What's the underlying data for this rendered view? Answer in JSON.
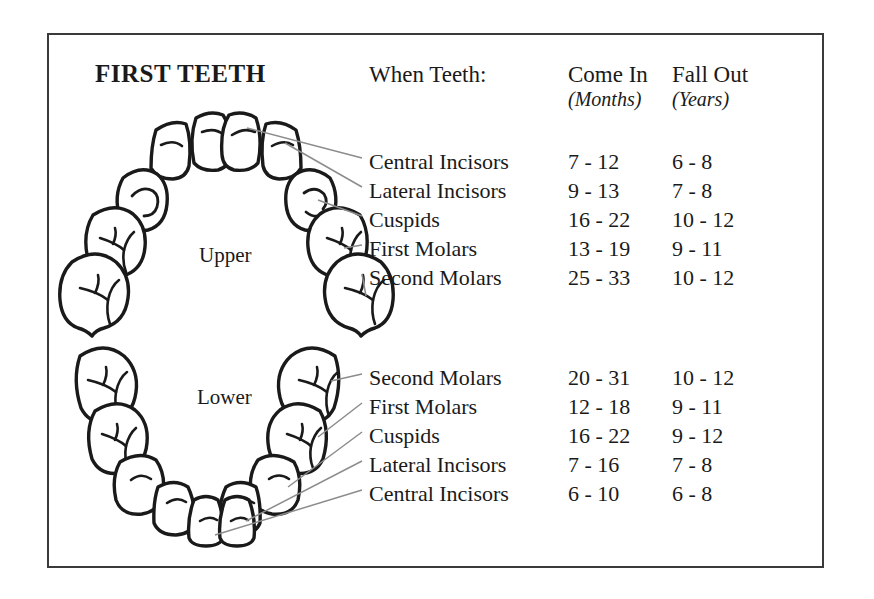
{
  "title": "FIRST TEETH",
  "headers": {
    "when": "When Teeth:",
    "come_in": "Come In",
    "come_in_unit": "(Months)",
    "fall_out": "Fall Out",
    "fall_out_unit": "(Years)"
  },
  "arch_labels": {
    "upper": "Upper",
    "lower": "Lower"
  },
  "colors": {
    "frame": "#3a3a3a",
    "ink": "#1a1a1a",
    "leader_line": "#8c8c8c",
    "tooth_outline": "#1a1a1a",
    "background": "#ffffff"
  },
  "chart_data": {
    "type": "table",
    "title": "FIRST TEETH",
    "columns": [
      "When Teeth:",
      "Come In (Months)",
      "Fall Out (Years)"
    ],
    "sections": [
      {
        "arch": "Upper",
        "rows": [
          {
            "name": "Central Incisors",
            "come_in": "7 - 12",
            "fall_out": "6 - 8"
          },
          {
            "name": "Lateral Incisors",
            "come_in": "9 - 13",
            "fall_out": "7 - 8"
          },
          {
            "name": "Cuspids",
            "come_in": "16 - 22",
            "fall_out": "10 - 12"
          },
          {
            "name": "First Molars",
            "come_in": "13 - 19",
            "fall_out": "9 - 11"
          },
          {
            "name": "Second Molars",
            "come_in": "25 - 33",
            "fall_out": "10 - 12"
          }
        ]
      },
      {
        "arch": "Lower",
        "rows": [
          {
            "name": "Second Molars",
            "come_in": "20 - 31",
            "fall_out": "10 - 12"
          },
          {
            "name": "First Molars",
            "come_in": "12 - 18",
            "fall_out": "9 - 11"
          },
          {
            "name": "Cuspids",
            "come_in": "16 - 22",
            "fall_out": "9 - 12"
          },
          {
            "name": "Lateral Incisors",
            "come_in": "7 - 16",
            "fall_out": "7 - 8"
          },
          {
            "name": "Central Incisors",
            "come_in": "6 - 10",
            "fall_out": "6 - 8"
          }
        ]
      }
    ]
  },
  "icons": {
    "upper_arch": "upper-dental-arch-icon",
    "lower_arch": "lower-dental-arch-icon"
  }
}
